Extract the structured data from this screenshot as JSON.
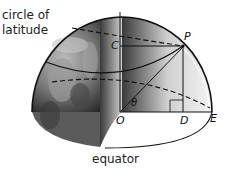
{
  "diagram": {
    "labels": {
      "circle_of_latitude_line1": "circle of",
      "circle_of_latitude_line2": "latitude",
      "equator": "equator"
    },
    "points": {
      "C": "C",
      "P": "P",
      "O": "O",
      "D": "D",
      "E": "E",
      "theta": "θ"
    },
    "colors": {
      "line": "#111111",
      "globe_dark": "#2a2a2a",
      "globe_light": "#d8d8d8",
      "background": "#ffffff"
    }
  }
}
